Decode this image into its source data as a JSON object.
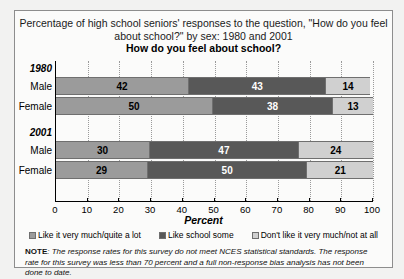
{
  "title": "Percentage of high school seniors' responses to the question, \"How do you feel about school?\" by sex: 1980 and 2001",
  "subtitle": "How do you feel about school?",
  "note_label": "NOTE",
  "note_text": ": The response rates for this survey do not meet NCES statistical standards. The response rate for this survey was less than 70 percent and a full non-response bias analysis has not been done to date.",
  "colors": {
    "series0": "#9b9b9b",
    "series1": "#585858",
    "series2": "#d0d0d0",
    "axis": "#000000",
    "panel": "#fbfbfa"
  },
  "chart_data": {
    "type": "bar",
    "orientation": "horizontal",
    "stacked": true,
    "title": "How do you feel about school?",
    "xlabel": "Percent",
    "ylabel": "",
    "xlim": [
      0,
      100
    ],
    "xticks": [
      0,
      10,
      20,
      30,
      40,
      50,
      60,
      70,
      80,
      90,
      100
    ],
    "grid": true,
    "legend_position": "bottom",
    "groups": [
      {
        "label": "1980",
        "rows": [
          {
            "label": "Male",
            "values": [
              42,
              43,
              14
            ]
          },
          {
            "label": "Female",
            "values": [
              50,
              38,
              13
            ]
          }
        ]
      },
      {
        "label": "2001",
        "rows": [
          {
            "label": "Male",
            "values": [
              30,
              47,
              24
            ]
          },
          {
            "label": "Female",
            "values": [
              29,
              50,
              21
            ]
          }
        ]
      }
    ],
    "series": [
      {
        "name": "Like it very much/quite a lot",
        "values": [
          42,
          50,
          30,
          29
        ]
      },
      {
        "name": "Like school some",
        "values": [
          43,
          38,
          47,
          50
        ]
      },
      {
        "name": "Don't like it very much/not at all",
        "values": [
          14,
          13,
          24,
          21
        ]
      }
    ],
    "categories": [
      "1980 Male",
      "1980 Female",
      "2001 Male",
      "2001 Female"
    ]
  }
}
